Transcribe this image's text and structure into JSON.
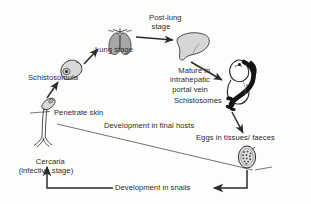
{
  "diagram": {
    "background_color": "#fdfdfb",
    "ink_color": "#2b2b2b",
    "organ_fill": "#b9b9b9",
    "worm_fill": "#1a1a1a",
    "labels": {
      "post_lung_stage": "Post-lung\nstage",
      "lung_stage": "Lung stage",
      "schistosomula": "Schistosomula",
      "mature_portal_vein": "Mature in\nintrahepatic\nportal vein",
      "schistosomes": "Schistosomes",
      "penetrate_skin": "Penetrate skin",
      "development_final_hosts": "Development in final hosts",
      "eggs_tissues_faeces": "Eggs in tissues/ faeces",
      "cercaria": "Cercaria\n(infective stage)",
      "development_snails": "Development in snails"
    },
    "stages": [
      {
        "name": "cercaria",
        "label": "Cercaria (infective stage)",
        "icon": "cercaria-larva"
      },
      {
        "name": "schistosomula",
        "label": "Schistosomula",
        "icon": "schistosomula-larva"
      },
      {
        "name": "lung-stage",
        "label": "Lung stage",
        "icon": "lungs"
      },
      {
        "name": "post-lung-stage",
        "label": "Post-lung stage",
        "icon": "liver"
      },
      {
        "name": "portal-vein",
        "label": "Mature in intrahepatic portal vein",
        "icon": "paired-worms"
      },
      {
        "name": "schistosomes",
        "label": "Schistosomes",
        "icon": "worm"
      },
      {
        "name": "eggs",
        "label": "Eggs in tissues/ faeces",
        "icon": "egg"
      }
    ],
    "flow_arrows": [
      "cercaria-to-schistosomula",
      "schistosomula-to-lungs",
      "lungs-to-liver",
      "liver-to-portal-vein",
      "worms-to-eggs",
      "eggs-to-cercaria"
    ]
  }
}
